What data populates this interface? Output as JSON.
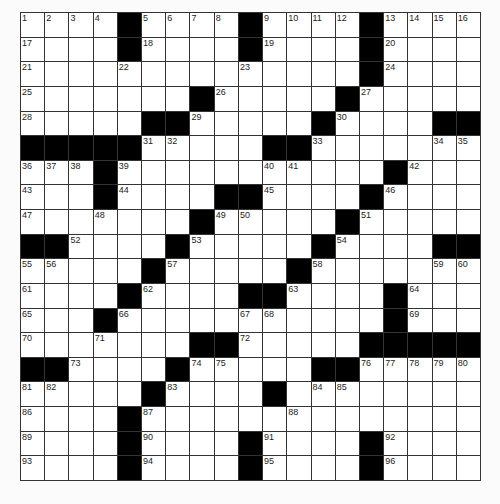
{
  "puzzle": {
    "rows": 19,
    "cols": 19,
    "grid": [
      "....#....#....#....",
      "....#....#....#....",
      "..............#....",
      ".......#.....#.....",
      ".....##.....#....##",
      "#####.....##.......",
      "...#...........#...",
      "...#....##....#....",
      ".......#.....#.....",
      "##....#.....#....##",
      ".....#.....#.......",
      "....#....##....#...",
      "...#...........#...",
      ".......##.....#####",
      "##....#.....##.....",
      ".....#....#........",
      "....#..............",
      "....#....#....#....",
      "....#....#....#...."
    ],
    "numbers": [
      {
        "r": 0,
        "c": 0,
        "n": 1
      },
      {
        "r": 0,
        "c": 1,
        "n": 2
      },
      {
        "r": 0,
        "c": 2,
        "n": 3
      },
      {
        "r": 0,
        "c": 3,
        "n": 4
      },
      {
        "r": 0,
        "c": 5,
        "n": 5
      },
      {
        "r": 0,
        "c": 6,
        "n": 6
      },
      {
        "r": 0,
        "c": 7,
        "n": 7
      },
      {
        "r": 0,
        "c": 8,
        "n": 8
      },
      {
        "r": 0,
        "c": 10,
        "n": 9
      },
      {
        "r": 0,
        "c": 11,
        "n": 10
      },
      {
        "r": 0,
        "c": 12,
        "n": 11
      },
      {
        "r": 0,
        "c": 13,
        "n": 12
      },
      {
        "r": 0,
        "c": 15,
        "n": 13
      },
      {
        "r": 0,
        "c": 16,
        "n": 14
      },
      {
        "r": 0,
        "c": 17,
        "n": 15
      },
      {
        "r": 0,
        "c": 18,
        "n": 16
      },
      {
        "r": 1,
        "c": 0,
        "n": 17
      },
      {
        "r": 1,
        "c": 5,
        "n": 18
      },
      {
        "r": 1,
        "c": 10,
        "n": 19
      },
      {
        "r": 1,
        "c": 15,
        "n": 20
      },
      {
        "r": 2,
        "c": 0,
        "n": 21
      },
      {
        "r": 2,
        "c": 4,
        "n": 22
      },
      {
        "r": 2,
        "c": 9,
        "n": 23
      },
      {
        "r": 2,
        "c": 15,
        "n": 24
      },
      {
        "r": 3,
        "c": 0,
        "n": 25
      },
      {
        "r": 3,
        "c": 8,
        "n": 26
      },
      {
        "r": 3,
        "c": 14,
        "n": 27
      },
      {
        "r": 4,
        "c": 0,
        "n": 28
      },
      {
        "r": 4,
        "c": 7,
        "n": 29
      },
      {
        "r": 4,
        "c": 13,
        "n": 30
      },
      {
        "r": 5,
        "c": 5,
        "n": 31
      },
      {
        "r": 5,
        "c": 6,
        "n": 32
      },
      {
        "r": 5,
        "c": 12,
        "n": 33
      },
      {
        "r": 5,
        "c": 17,
        "n": 34
      },
      {
        "r": 5,
        "c": 18,
        "n": 35
      },
      {
        "r": 6,
        "c": 0,
        "n": 36
      },
      {
        "r": 6,
        "c": 1,
        "n": 37
      },
      {
        "r": 6,
        "c": 2,
        "n": 38
      },
      {
        "r": 6,
        "c": 4,
        "n": 39
      },
      {
        "r": 6,
        "c": 10,
        "n": 40
      },
      {
        "r": 6,
        "c": 11,
        "n": 41
      },
      {
        "r": 6,
        "c": 16,
        "n": 42
      },
      {
        "r": 7,
        "c": 0,
        "n": 43
      },
      {
        "r": 7,
        "c": 4,
        "n": 44
      },
      {
        "r": 7,
        "c": 10,
        "n": 45
      },
      {
        "r": 7,
        "c": 15,
        "n": 46
      },
      {
        "r": 8,
        "c": 0,
        "n": 47
      },
      {
        "r": 8,
        "c": 3,
        "n": 48
      },
      {
        "r": 8,
        "c": 8,
        "n": 49
      },
      {
        "r": 8,
        "c": 9,
        "n": 50
      },
      {
        "r": 8,
        "c": 14,
        "n": 51
      },
      {
        "r": 9,
        "c": 2,
        "n": 52
      },
      {
        "r": 9,
        "c": 7,
        "n": 53
      },
      {
        "r": 9,
        "c": 13,
        "n": 54
      },
      {
        "r": 10,
        "c": 0,
        "n": 55
      },
      {
        "r": 10,
        "c": 1,
        "n": 56
      },
      {
        "r": 10,
        "c": 6,
        "n": 57
      },
      {
        "r": 10,
        "c": 12,
        "n": 58
      },
      {
        "r": 10,
        "c": 17,
        "n": 59
      },
      {
        "r": 10,
        "c": 18,
        "n": 60
      },
      {
        "r": 11,
        "c": 0,
        "n": 61
      },
      {
        "r": 11,
        "c": 5,
        "n": 62
      },
      {
        "r": 11,
        "c": 11,
        "n": 63
      },
      {
        "r": 11,
        "c": 16,
        "n": 64
      },
      {
        "r": 12,
        "c": 0,
        "n": 65
      },
      {
        "r": 12,
        "c": 4,
        "n": 66
      },
      {
        "r": 12,
        "c": 9,
        "n": 67
      },
      {
        "r": 12,
        "c": 10,
        "n": 68
      },
      {
        "r": 12,
        "c": 16,
        "n": 69
      },
      {
        "r": 13,
        "c": 0,
        "n": 70
      },
      {
        "r": 13,
        "c": 3,
        "n": 71
      },
      {
        "r": 13,
        "c": 9,
        "n": 72
      },
      {
        "r": 14,
        "c": 2,
        "n": 73
      },
      {
        "r": 14,
        "c": 7,
        "n": 74
      },
      {
        "r": 14,
        "c": 8,
        "n": 75
      },
      {
        "r": 14,
        "c": 14,
        "n": 76
      },
      {
        "r": 14,
        "c": 15,
        "n": 77
      },
      {
        "r": 14,
        "c": 16,
        "n": 78
      },
      {
        "r": 14,
        "c": 17,
        "n": 79
      },
      {
        "r": 14,
        "c": 18,
        "n": 80
      },
      {
        "r": 15,
        "c": 0,
        "n": 81
      },
      {
        "r": 15,
        "c": 1,
        "n": 82
      },
      {
        "r": 15,
        "c": 6,
        "n": 83
      },
      {
        "r": 15,
        "c": 12,
        "n": 84
      },
      {
        "r": 15,
        "c": 13,
        "n": 85
      },
      {
        "r": 16,
        "c": 0,
        "n": 86
      },
      {
        "r": 16,
        "c": 5,
        "n": 87
      },
      {
        "r": 16,
        "c": 11,
        "n": 88
      },
      {
        "r": 17,
        "c": 0,
        "n": 89
      },
      {
        "r": 17,
        "c": 5,
        "n": 90
      },
      {
        "r": 17,
        "c": 10,
        "n": 91
      },
      {
        "r": 17,
        "c": 15,
        "n": 92
      },
      {
        "r": 18,
        "c": 0,
        "n": 93
      },
      {
        "r": 18,
        "c": 5,
        "n": 94
      },
      {
        "r": 18,
        "c": 10,
        "n": 95
      },
      {
        "r": 18,
        "c": 15,
        "n": 96
      }
    ],
    "colors": {
      "block": "#000000",
      "cell": "#ffffff",
      "line": "#333333",
      "background": "#fbfbfb"
    }
  }
}
